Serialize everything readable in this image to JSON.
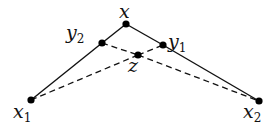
{
  "diagram": {
    "type": "geometric-points",
    "points": [
      {
        "id": "x",
        "label": "x",
        "sub": "",
        "cx": 126,
        "cy": 24,
        "lx": 119,
        "ly": 18
      },
      {
        "id": "y2",
        "label": "y",
        "sub": "2",
        "cx": 102,
        "cy": 43,
        "lx": 66,
        "ly": 39
      },
      {
        "id": "y1",
        "label": "y",
        "sub": "1",
        "cx": 163,
        "cy": 45,
        "lx": 168,
        "ly": 48
      },
      {
        "id": "z",
        "label": "z",
        "sub": "",
        "cx": 138,
        "cy": 55,
        "lx": 128,
        "ly": 72
      },
      {
        "id": "x1",
        "label": "x",
        "sub": "1",
        "cx": 31,
        "cy": 100,
        "lx": 13,
        "ly": 118
      },
      {
        "id": "x2",
        "label": "x",
        "sub": "2",
        "cx": 259,
        "cy": 101,
        "lx": 243,
        "ly": 118
      }
    ],
    "solid_edges": [
      [
        "x1",
        "y2"
      ],
      [
        "y2",
        "x"
      ],
      [
        "x",
        "y1"
      ],
      [
        "y1",
        "x2"
      ]
    ],
    "dashed_edges": [
      [
        "y2",
        "z"
      ],
      [
        "z",
        "x2"
      ],
      [
        "x1",
        "z"
      ],
      [
        "z",
        "y1"
      ]
    ],
    "colors": {
      "stroke": "#111111",
      "point": "#000000",
      "background": "#ffffff"
    }
  }
}
